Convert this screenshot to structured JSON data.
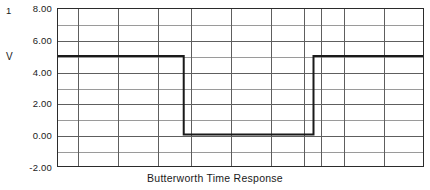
{
  "chart_data": {
    "type": "line",
    "title": "Butterworth Time Response",
    "series_index_label": "1",
    "ylabel": "V",
    "xlabel": "",
    "ylim": [
      -2.0,
      8.0
    ],
    "xlim": [
      0,
      18
    ],
    "grid": true,
    "legend": "none",
    "y_tick_labels": [
      "8.00",
      "6.00",
      "4.00",
      "2.00",
      "0.00",
      "-2.00"
    ],
    "y_tick_values": [
      8.0,
      6.0,
      4.0,
      2.0,
      0.0,
      -2.0
    ],
    "y_minor_tick_values": [
      7.0,
      5.0,
      3.0,
      1.0,
      -1.0
    ],
    "x_gridline_values": [
      1,
      2,
      4,
      6,
      7,
      8,
      10,
      12,
      13,
      14,
      16
    ],
    "series": [
      {
        "name": "V",
        "high_level": 5.0,
        "low_level": 0.0,
        "points": [
          {
            "x": 0,
            "y": 5.0
          },
          {
            "x": 6.2,
            "y": 5.0
          },
          {
            "x": 6.2,
            "y": 0.0
          },
          {
            "x": 12.6,
            "y": 0.0
          },
          {
            "x": 12.6,
            "y": 5.0
          },
          {
            "x": 18,
            "y": 5.0
          }
        ]
      }
    ],
    "colors": {
      "trace": "#1a1a1a",
      "major_grid": "#5e5e5e",
      "minor_grid": "#9a9a9a",
      "frame": "#2b2b2b",
      "background": "#ffffff"
    }
  }
}
